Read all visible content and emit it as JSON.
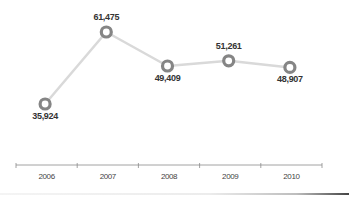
{
  "chart_data": {
    "type": "line",
    "title": "",
    "xlabel": "",
    "ylabel": "",
    "categories": [
      "2006",
      "2007",
      "2008",
      "2009",
      "2010"
    ],
    "values": [
      35924,
      61475,
      49409,
      51261,
      48907
    ],
    "value_labels": [
      "35,924",
      "61,475",
      "49,409",
      "51,261",
      "48,907"
    ],
    "series": [
      {
        "name": "",
        "values": [
          35924,
          61475,
          49409,
          51261,
          48907
        ]
      }
    ],
    "grid": false,
    "legend": null,
    "y_axis_visible": false,
    "marker": "ring"
  },
  "colors": {
    "line": "#d9d9d9",
    "marker": "#858585",
    "axis": "#8a8a8a",
    "text": "#333333"
  }
}
